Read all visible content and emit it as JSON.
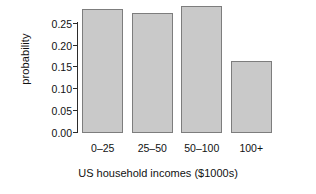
{
  "chart_data": {
    "type": "bar",
    "title": "",
    "xlabel": "US household incomes ($1000s)",
    "ylabel": "probability",
    "categories": [
      "0–25",
      "25–50",
      "50–100",
      "100+"
    ],
    "values": [
      0.279,
      0.27,
      0.285,
      0.161
    ],
    "ylim": [
      0.0,
      0.29
    ],
    "yticks": [
      0.0,
      0.05,
      0.1,
      0.15,
      0.2,
      0.25
    ],
    "ytick_labels": [
      "0.00",
      "0.05",
      "0.10",
      "0.15",
      "0.20",
      "0.25"
    ],
    "grid": false,
    "legend": null,
    "bar_fill_color": "#c9c9c9",
    "bar_edge_color": "#7d7d7d",
    "axis_color": "#2b2b2b",
    "background_color": "#ffffff"
  }
}
